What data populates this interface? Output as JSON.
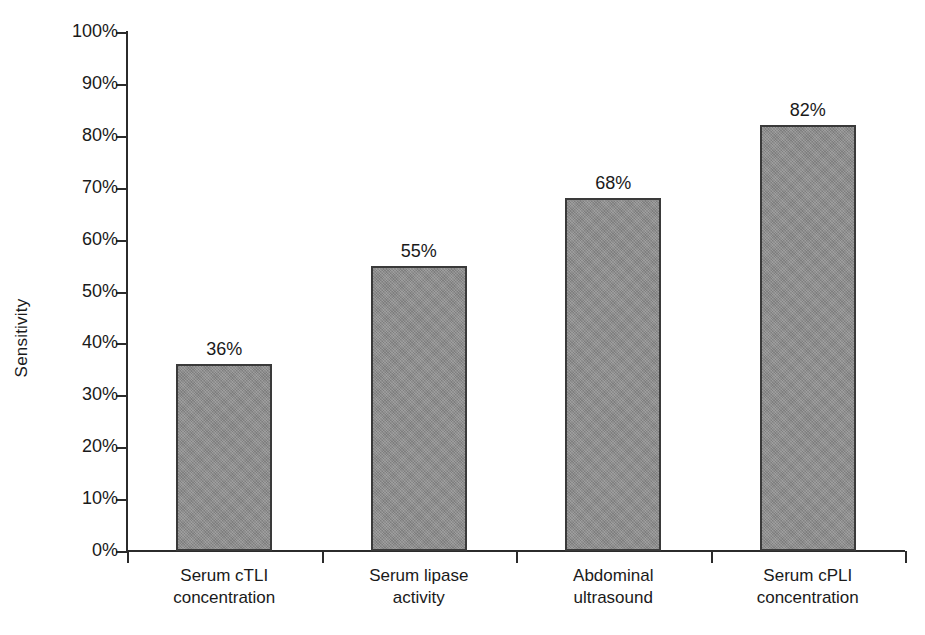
{
  "chart_data": {
    "type": "bar",
    "title": "",
    "xlabel": "",
    "ylabel": "Sensitivity",
    "ylim": [
      0,
      100
    ],
    "grid": false,
    "legend": "none",
    "categories": [
      "Serum cTLI concentration",
      "Serum lipase activity",
      "Abdominal ultrasound",
      "Serum cPLI concentration"
    ],
    "category_lines": [
      [
        "Serum cTLI",
        "concentration"
      ],
      [
        "Serum lipase",
        "activity"
      ],
      [
        "Abdominal",
        "ultrasound"
      ],
      [
        "Serum cPLI",
        "concentration"
      ]
    ],
    "values": [
      36,
      55,
      68,
      82
    ],
    "value_labels": [
      "36%",
      "55%",
      "68%",
      "82%"
    ],
    "y_ticks": [
      0,
      10,
      20,
      30,
      40,
      50,
      60,
      70,
      80,
      90,
      100
    ],
    "y_tick_labels": [
      "0%",
      "10%",
      "20%",
      "30%",
      "40%",
      "50%",
      "60%",
      "70%",
      "80%",
      "90%",
      "100%"
    ],
    "bar_color": "#8a8a8a",
    "bar_edge_color": "#3a3a3a",
    "axis_color": "#2b2b2b",
    "background": "#ffffff"
  }
}
